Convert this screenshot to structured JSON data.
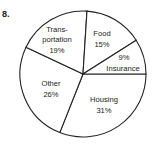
{
  "problem_number": "8.",
  "chart_data": {
    "type": "pie",
    "title": "",
    "start_angle_deg": 0,
    "direction": "clockwise",
    "slices": [
      {
        "label": "Housing",
        "value": 31,
        "value_label": "31%"
      },
      {
        "label": "Other",
        "value": 26,
        "value_label": "26%"
      },
      {
        "label": "Trans-portation",
        "value": 19,
        "value_label": "19%"
      },
      {
        "label": "Food",
        "value": 15,
        "value_label": "15%"
      },
      {
        "label": "Insurance",
        "value": 9,
        "value_label": "9%"
      }
    ],
    "categories": [
      "Housing",
      "Other",
      "Transportation",
      "Food",
      "Insurance"
    ],
    "values": [
      31,
      26,
      19,
      15,
      9
    ],
    "fill": "#ffffff",
    "stroke": "#222222"
  },
  "labels": {
    "housing": {
      "name": "Housing",
      "pct": "31%"
    },
    "other": {
      "name": "Other",
      "pct": "26%"
    },
    "transportation": {
      "name1": "Trans-",
      "name2": "portation",
      "pct": "19%"
    },
    "food": {
      "name": "Food",
      "pct": "15%"
    },
    "insurance": {
      "name": "Insurance",
      "pct": "9%"
    }
  }
}
